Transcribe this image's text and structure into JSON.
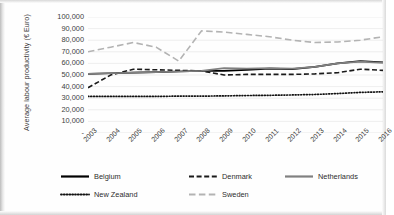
{
  "chart_data": {
    "type": "line",
    "title": "",
    "xlabel": "",
    "ylabel": "Average labour productivity (€ Euro)",
    "categories": [
      "2003",
      "2004",
      "2005",
      "2006",
      "2007",
      "2008",
      "2009",
      "2010",
      "2011",
      "2012",
      "2013",
      "2014",
      "2015",
      "2016"
    ],
    "ylim": [
      0,
      100000
    ],
    "ytick_labels": [
      "100,000",
      "90,000",
      "80,000",
      "70,000",
      "60,000",
      "50,000",
      "40,000",
      "30,000",
      "20,000",
      "10,000",
      "-"
    ],
    "ytick_values": [
      100000,
      90000,
      80000,
      70000,
      60000,
      50000,
      40000,
      30000,
      20000,
      10000,
      0
    ],
    "grid": "horizontal",
    "legend_position": "bottom",
    "series": [
      {
        "name": "Belgium",
        "style": "solid",
        "color": "#000000",
        "values": [
          51000,
          51500,
          52000,
          52500,
          53000,
          53500,
          53500,
          54500,
          55500,
          55000,
          57000,
          60000,
          62000,
          61000
        ]
      },
      {
        "name": "Denmark",
        "style": "dashed",
        "color": "#1a1a1a",
        "values": [
          39000,
          50000,
          55000,
          54500,
          54000,
          53500,
          50000,
          50500,
          50500,
          50500,
          51000,
          52000,
          55000,
          54000
        ]
      },
      {
        "name": "Netherlands",
        "style": "solid",
        "color": "#808080",
        "values": [
          51000,
          51500,
          52000,
          52500,
          53000,
          53500,
          56000,
          55500,
          56000,
          55500,
          57000,
          60000,
          61500,
          60500
        ]
      },
      {
        "name": "New Zealand",
        "style": "dotted",
        "color": "#111111",
        "values": [
          31500,
          31500,
          31500,
          31500,
          31800,
          31800,
          32000,
          32300,
          32500,
          32800,
          33200,
          34000,
          35000,
          35500
        ]
      },
      {
        "name": "Sweden",
        "style": "longdash",
        "color": "#b3b3b3",
        "values": [
          70000,
          74000,
          78000,
          74000,
          62000,
          88000,
          87000,
          85000,
          83000,
          80000,
          78000,
          78500,
          80000,
          83000
        ]
      }
    ]
  },
  "legend": {
    "items": [
      {
        "label": "Belgium"
      },
      {
        "label": "Denmark"
      },
      {
        "label": "Netherlands"
      },
      {
        "label": "New Zealand"
      },
      {
        "label": "Sweden"
      }
    ]
  }
}
